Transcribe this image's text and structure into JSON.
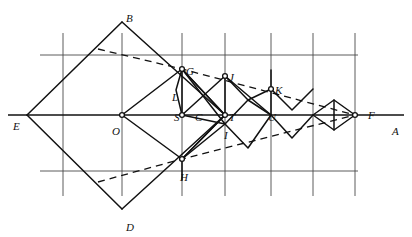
{
  "figure": {
    "width": 412,
    "height": 237,
    "background": "#ffffff",
    "ink_color": "#111111",
    "grid_color": "#4a4a4a",
    "axis_color": "#111111",
    "dashed_color": "#111111"
  },
  "grid": {
    "vertical_x": [
      63,
      122,
      182,
      225,
      271,
      313,
      355
    ],
    "vertical_top": 33,
    "vertical_bottom": 196,
    "horizontal_y": [
      55,
      171
    ],
    "horizontal_left": 40,
    "horizontal_right": 358
  },
  "axis": {
    "name": "EA",
    "y": 115,
    "x_start": 8,
    "x_end": 404
  },
  "points": {
    "E": {
      "x": 27,
      "y": 115,
      "label": "E",
      "lx": 13,
      "ly": 121,
      "marker": false
    },
    "B": {
      "x": 122,
      "y": 22,
      "label": "B",
      "lx": 126,
      "ly": 13,
      "marker": false
    },
    "D": {
      "x": 122,
      "y": 209,
      "label": "D",
      "lx": 126,
      "ly": 222,
      "marker": false
    },
    "O": {
      "x": 122,
      "y": 115,
      "label": "O",
      "lx": 112,
      "ly": 126,
      "marker": true
    },
    "G": {
      "x": 182,
      "y": 69,
      "label": "G",
      "lx": 186,
      "ly": 66,
      "marker": true
    },
    "L": {
      "x": 182,
      "y": 88,
      "label": "L",
      "lx": 172,
      "ly": 92,
      "marker": false
    },
    "S": {
      "x": 182,
      "y": 115,
      "label": "S",
      "lx": 174,
      "ly": 112,
      "marker": true
    },
    "C": {
      "x": 200,
      "y": 115,
      "label": "C",
      "lx": 195,
      "ly": 112,
      "marker": false
    },
    "H": {
      "x": 182,
      "y": 159,
      "label": "H",
      "lx": 180,
      "ly": 172,
      "marker": true
    },
    "J": {
      "x": 225,
      "y": 76,
      "label": "J",
      "lx": 229,
      "ly": 72,
      "marker": true
    },
    "T": {
      "x": 225,
      "y": 115,
      "label": "T",
      "lx": 229,
      "ly": 112,
      "marker": true
    },
    "I": {
      "x": 225,
      "y": 124,
      "label": "I",
      "lx": 224,
      "ly": 130,
      "marker": false
    },
    "K": {
      "x": 271,
      "y": 89,
      "label": "K",
      "lx": 275,
      "ly": 85,
      "marker": true
    },
    "U": {
      "x": 271,
      "y": 115,
      "label": "U",
      "lx": 268,
      "ly": 112,
      "marker": false
    },
    "F": {
      "x": 355,
      "y": 115,
      "label": "F",
      "lx": 368,
      "ly": 110,
      "marker": true
    },
    "A": {
      "x": 400,
      "y": 115,
      "label": "A",
      "lx": 392,
      "ly": 126,
      "marker": false
    }
  },
  "solid_paths": [
    {
      "name": "big-rhombus-EBAD-left-upper",
      "pts": [
        [
          27,
          115
        ],
        [
          122,
          22
        ]
      ]
    },
    {
      "name": "big-rhombus-upper-right",
      "pts": [
        [
          122,
          22
        ],
        [
          225,
          115
        ]
      ]
    },
    {
      "name": "big-rhombus-lower-right",
      "pts": [
        [
          225,
          115
        ],
        [
          122,
          209
        ]
      ]
    },
    {
      "name": "big-rhombus-lower-left",
      "pts": [
        [
          122,
          209
        ],
        [
          27,
          115
        ]
      ]
    },
    {
      "name": "inner-rhombus-O-G-T-H",
      "pts": [
        [
          122,
          115
        ],
        [
          182,
          69
        ],
        [
          225,
          115
        ],
        [
          182,
          159
        ],
        [
          122,
          115
        ]
      ]
    },
    {
      "name": "zigzag-G-to-S",
      "pts": [
        [
          182,
          69
        ],
        [
          182,
          115
        ]
      ]
    },
    {
      "name": "chevron-G-L-S",
      "pts": [
        [
          182,
          69
        ],
        [
          176,
          90
        ],
        [
          182,
          115
        ]
      ]
    },
    {
      "name": "rhombus-S-J-U-I-upper",
      "pts": [
        [
          182,
          115
        ],
        [
          225,
          76
        ],
        [
          271,
          115
        ]
      ]
    },
    {
      "name": "rhombus-S-J-U-I-lower",
      "pts": [
        [
          182,
          115
        ],
        [
          225,
          124
        ],
        [
          248,
          100
        ],
        [
          271,
          115
        ]
      ]
    },
    {
      "name": "ray-G-to-I",
      "pts": [
        [
          182,
          69
        ],
        [
          225,
          124
        ]
      ]
    },
    {
      "name": "ray-G-to-T",
      "pts": [
        [
          182,
          69
        ],
        [
          225,
          115
        ]
      ]
    },
    {
      "name": "ray-H-to-T",
      "pts": [
        [
          182,
          159
        ],
        [
          225,
          115
        ]
      ]
    },
    {
      "name": "lower-zig-H-to-U",
      "pts": [
        [
          182,
          159
        ],
        [
          225,
          124
        ],
        [
          248,
          148
        ],
        [
          271,
          115
        ]
      ]
    },
    {
      "name": "upper-zig-J-to-K",
      "pts": [
        [
          225,
          76
        ],
        [
          248,
          100
        ],
        [
          271,
          89
        ]
      ]
    },
    {
      "name": "zig-U-K-small",
      "pts": [
        [
          271,
          115
        ],
        [
          271,
          89
        ]
      ]
    },
    {
      "name": "chevron-K-right",
      "pts": [
        [
          271,
          89
        ],
        [
          292,
          110
        ],
        [
          313,
          89
        ]
      ]
    },
    {
      "name": "chevron-lower-right",
      "pts": [
        [
          271,
          115
        ],
        [
          292,
          138
        ],
        [
          313,
          115
        ]
      ]
    },
    {
      "name": "diamond-right",
      "pts": [
        [
          313,
          115
        ],
        [
          334,
          100
        ],
        [
          355,
          115
        ],
        [
          334,
          130
        ],
        [
          313,
          115
        ]
      ]
    },
    {
      "name": "diamond-right-vert",
      "pts": [
        [
          334,
          100
        ],
        [
          334,
          130
        ]
      ]
    },
    {
      "name": "spoke-K-up",
      "pts": [
        [
          271,
          89
        ],
        [
          271,
          70
        ]
      ]
    },
    {
      "name": "spoke-J-down",
      "pts": [
        [
          225,
          76
        ],
        [
          225,
          115
        ]
      ]
    },
    {
      "name": "spoke-H-down",
      "pts": [
        [
          182,
          159
        ],
        [
          182,
          180
        ]
      ]
    }
  ],
  "dashed_paths": [
    {
      "name": "envelope-upper-B-to-F",
      "pts": [
        [
          98,
          49
        ],
        [
          182,
          69
        ],
        [
          355,
          115
        ]
      ]
    },
    {
      "name": "envelope-lower-D-to-F",
      "pts": [
        [
          98,
          182
        ],
        [
          182,
          159
        ],
        [
          355,
          115
        ]
      ]
    }
  ],
  "labels_order": [
    "B",
    "G",
    "J",
    "K",
    "F",
    "E",
    "O",
    "S",
    "C",
    "T",
    "U",
    "A",
    "L",
    "I",
    "H",
    "D"
  ]
}
